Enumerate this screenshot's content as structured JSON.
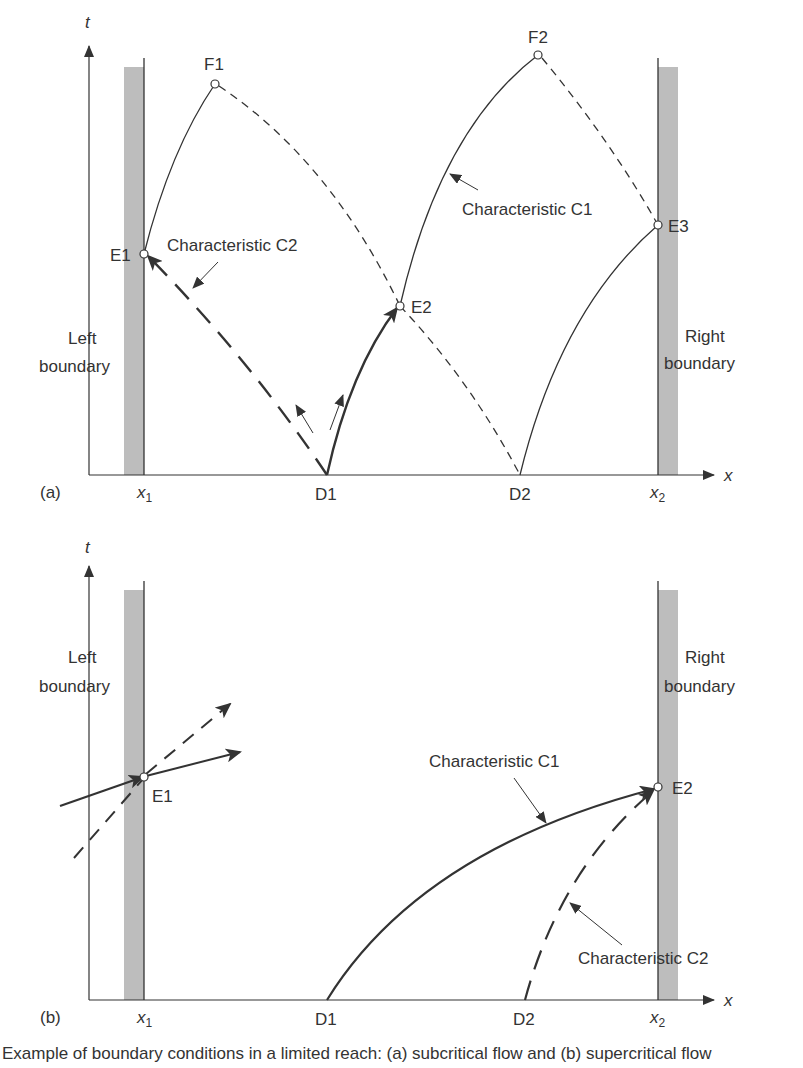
{
  "figure": {
    "type": "characteristics-diagram",
    "caption": "Example of boundary conditions in a limited reach: (a) subcritical flow and (b) supercritical flow",
    "colors": {
      "ink": "#333333",
      "boundary_band": "#bdbdbd",
      "background": "#ffffff"
    }
  },
  "panel_a": {
    "tag": "(a)",
    "axis_t": "t",
    "axis_x": "x",
    "x_ticks": {
      "x1": "x",
      "x1_sub": "1",
      "d1": "D1",
      "d2": "D2",
      "x2": "x",
      "x2_sub": "2"
    },
    "left_boundary": {
      "line1": "Left",
      "line2": "boundary"
    },
    "right_boundary": {
      "line1": "Right",
      "line2": "boundary"
    },
    "points": {
      "f1": "F1",
      "f2": "F2",
      "e1": "E1",
      "e2": "E2",
      "e3": "E3"
    },
    "annotations": {
      "c2": "Characteristic C2",
      "c1": "Characteristic C1"
    }
  },
  "panel_b": {
    "tag": "(b)",
    "axis_t": "t",
    "axis_x": "x",
    "x_ticks": {
      "x1": "x",
      "x1_sub": "1",
      "d1": "D1",
      "d2": "D2",
      "x2": "x",
      "x2_sub": "2"
    },
    "left_boundary": {
      "line1": "Left",
      "line2": "boundary"
    },
    "right_boundary": {
      "line1": "Right",
      "line2": "boundary"
    },
    "points": {
      "e1": "E1",
      "e2": "E2"
    },
    "annotations": {
      "c1": "Characteristic C1",
      "c2": "Characteristic C2"
    }
  }
}
